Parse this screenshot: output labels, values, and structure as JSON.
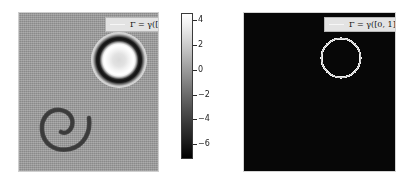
{
  "figure": {
    "type": "two-panel-image-figure",
    "background_color": "#ffffff",
    "width": 410,
    "height": 180
  },
  "legend": {
    "label": "Γ = γ([0, 1])",
    "line_color": "#f6f6f6",
    "box_facecolor": "#e3e3e3",
    "box_edgecolor": "#b7b7b7"
  },
  "panels": [
    {
      "name": "left-field-panel",
      "kind": "grayscale-scalar-field",
      "background_color": "#9a9a9a",
      "features": [
        {
          "name": "bright-ring",
          "description": "concentric bright ring with dark annulus, upper-right quadrant",
          "center_fraction": [
            0.71,
            0.29
          ],
          "radius_fraction": 0.2
        },
        {
          "name": "dark-spiral-arc",
          "description": "dark open C-shaped spiral arc, lower-left quadrant",
          "center_fraction": [
            0.34,
            0.72
          ],
          "radius_fraction": 0.17
        }
      ]
    },
    {
      "name": "right-binary-panel",
      "kind": "binary-mask",
      "background_color": "#070707",
      "features": [
        {
          "name": "white-ring-curve",
          "description": "white closed curve (rasterized circle) in upper-right quadrant",
          "center_fraction": [
            0.63,
            0.28
          ],
          "radius_fraction": 0.15,
          "color": "#f2f2f2"
        }
      ]
    }
  ],
  "chart_data": {
    "type": "heatmap",
    "title": "",
    "xlabel": "",
    "ylabel": "",
    "legend_position": "upper right",
    "grid": false,
    "colormap": "gray",
    "colorbar": {
      "orientation": "vertical",
      "vmin": -7.2,
      "vmax": 4.6,
      "tick_values": [
        4,
        2,
        0,
        -2,
        -4,
        -6
      ],
      "tick_labels": [
        "4",
        "2",
        "0",
        "−2",
        "−4",
        "−6"
      ],
      "gradient_from": "#ffffff",
      "gradient_to": "#000000"
    },
    "series": [
      {
        "name": "left panel scalar field",
        "description": "gray noisy background near value 0 with a high-amplitude ring feature and a negative spiral arc feature",
        "background_value": 0,
        "feature_peak_value": 4.6,
        "feature_min_value": -7.2
      },
      {
        "name": "right panel binary mask",
        "description": "black field value 0 with white curve value 1",
        "values": [
          0,
          1
        ]
      }
    ]
  }
}
